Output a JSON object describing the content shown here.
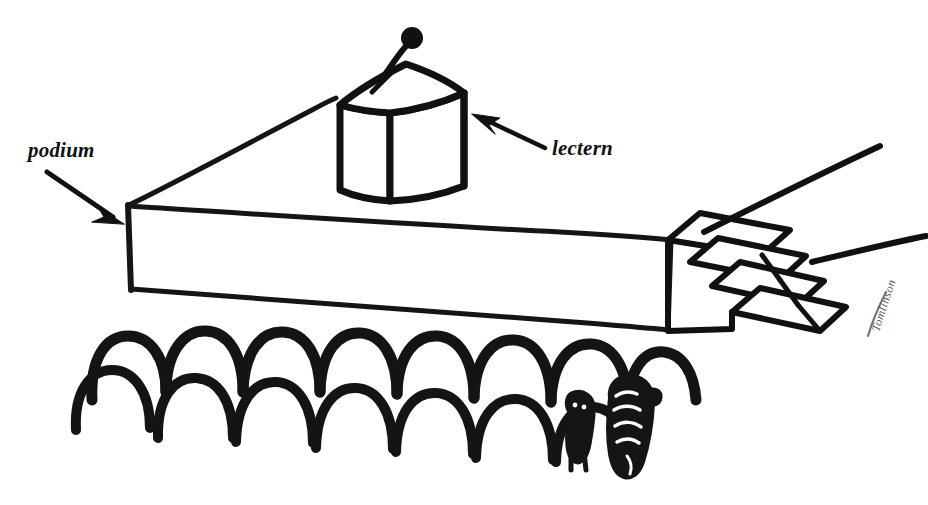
{
  "image": {
    "kind": "line-drawing",
    "title": "Podium with lectern, stairs and audience",
    "background_color": "#ffffff",
    "ink_color": "#111111",
    "width": 928,
    "height": 505
  },
  "labels": {
    "podium": "podium",
    "lectern": "lectern"
  },
  "signature": {
    "text": "Tomlinson"
  },
  "annotations": [
    {
      "name": "podium-callout",
      "label": "podium",
      "label_position": {
        "x": 28,
        "y": 140
      },
      "arrow_from": {
        "x": 48,
        "y": 172
      },
      "arrow_to": {
        "x": 123,
        "y": 222
      }
    },
    {
      "name": "lectern-callout",
      "label": "lectern",
      "label_position": {
        "x": 552,
        "y": 138
      },
      "arrow_from": {
        "x": 546,
        "y": 148
      },
      "arrow_to": {
        "x": 474,
        "y": 116
      }
    }
  ],
  "objects": {
    "podium": {
      "name": "podium",
      "description": "Long low rectangular stage platform drawn in perspective",
      "top_left": {
        "x": 128,
        "y": 205
      },
      "top_right": {
        "x": 672,
        "y": 240
      },
      "bottom_left": {
        "x": 131,
        "y": 289
      },
      "bottom_right": {
        "x": 668,
        "y": 330
      }
    },
    "lectern": {
      "name": "lectern",
      "description": "Tall box standing on the podium, with microphone",
      "x": 335,
      "y": 60,
      "width": 145,
      "height": 145
    },
    "microphone": {
      "name": "microphone",
      "description": "Small ball microphone on a bent stem rising from the lectern top",
      "head": {
        "x": 411,
        "y": 36
      },
      "base": {
        "x": 384,
        "y": 74
      }
    },
    "stairs": {
      "name": "stairs",
      "description": "Four-step staircase at the right end of the podium",
      "steps": 4,
      "x": 664,
      "y": 196,
      "width": 185,
      "height": 135
    },
    "handrails": {
      "name": "handrails",
      "description": "Two straight lines running off toward the upper right",
      "count": 2
    },
    "audience": {
      "name": "audience",
      "description": "Rows of rounded heads seen from behind, in front of the podium",
      "back_row_heads": 8,
      "front_row_heads": 7,
      "detailed_figure": {
        "name": "detailed-audience-member",
        "description": "Rightmost audience member drawn with facial and hair detail",
        "x": 560,
        "y": 380
      }
    }
  }
}
